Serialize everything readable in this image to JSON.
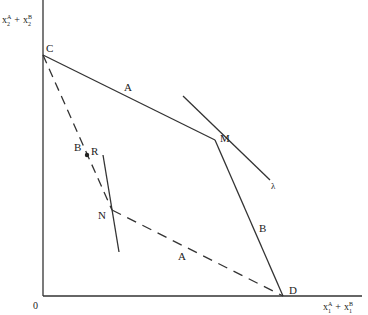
{
  "diagram": {
    "y_axis_label": {
      "base": "x",
      "sub1": "2",
      "sup1": "A",
      "plus": "+",
      "sub2": "2",
      "sup2": "B"
    },
    "x_axis_label": {
      "base": "x",
      "sub1": "1",
      "sup1": "A",
      "plus": "+",
      "sub2": "1",
      "sup2": "B"
    },
    "origin_label": "0",
    "points": {
      "C": "C",
      "M": "M",
      "D": "D",
      "N": "N",
      "R": "R"
    },
    "segment_labels": {
      "CM": "A",
      "MD": "B",
      "CN": "B",
      "ND": "A"
    },
    "price_line_label": "λ"
  }
}
